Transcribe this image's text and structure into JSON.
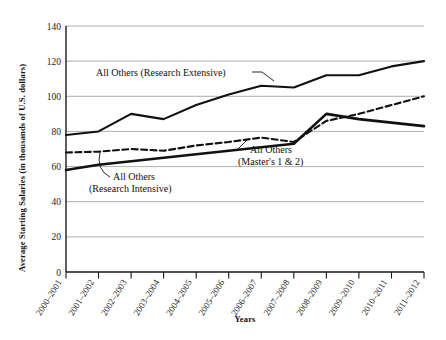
{
  "chart_data": {
    "type": "line",
    "title": "",
    "xlabel": "Years",
    "ylabel": "Average Starting Salaries (in thousands of U.S. dollars)",
    "ylim": [
      0,
      140
    ],
    "ytick_step": 20,
    "yticks": [
      "0",
      "20",
      "40",
      "60",
      "80",
      "100",
      "120",
      "140"
    ],
    "grid": true,
    "legend_position": "inline-annotations",
    "categories": [
      "2000–2001",
      "2001–2002",
      "2002–2003",
      "2003–2004",
      "2004–2005",
      "2005–2006",
      "2006–2007",
      "2007–2008",
      "2008–2009",
      "2009–2010",
      "2010–2011",
      "2011–2012"
    ],
    "series": [
      {
        "name": "All Others (Research Extensive)",
        "style": "solid-thin",
        "values": [
          78,
          80,
          90,
          87,
          95,
          101,
          106,
          105,
          112,
          112,
          117,
          120
        ]
      },
      {
        "name": "All Others (Master's 1 & 2)",
        "style": "dashed",
        "values": [
          68,
          68.5,
          70,
          69,
          72,
          74,
          76.5,
          74,
          86,
          90,
          95,
          100
        ]
      },
      {
        "name": "All Others (Research Intensive)",
        "style": "solid-thick",
        "values": [
          58,
          61,
          63,
          65,
          67,
          69,
          71,
          73,
          90,
          87,
          85,
          83
        ]
      }
    ],
    "annotations": [
      {
        "id": "extensive",
        "text": "All Others (Research Extensive)",
        "lines": [
          "All Others (Research Extensive)"
        ]
      },
      {
        "id": "intensive",
        "text": "All Others (Research Intensive)",
        "lines": [
          "All Others",
          "(Research Intensive)"
        ]
      },
      {
        "id": "masters",
        "text": "All Others (Master's 1 & 2)",
        "lines": [
          "All Others",
          "(Master's 1 & 2)"
        ]
      }
    ],
    "colors": {
      "line": "#111111",
      "grid": "#9a9a9a",
      "axis": "#1a1a1a",
      "background": "#ffffff"
    }
  }
}
